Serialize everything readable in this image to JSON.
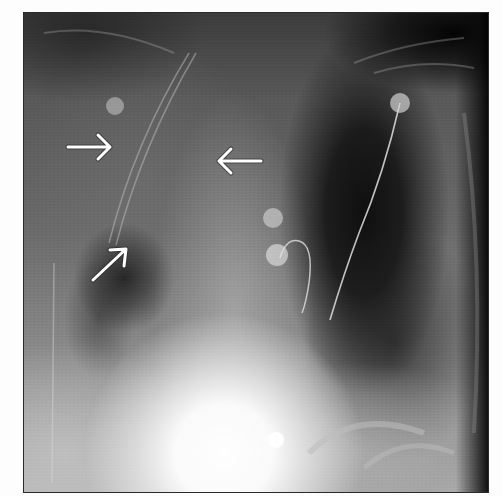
{
  "image": {
    "type": "chest radiograph (frontal view)",
    "frame": {
      "left": 24,
      "top": 13,
      "width": 464,
      "height": 479
    },
    "colors": {
      "page_background": "#fdfdfd",
      "dark_lung": "#141414",
      "mid_gray": "#6a6a6a",
      "bright_heart": "#ffffff",
      "annotation_arrow": "#ffffff"
    }
  },
  "annotations": {
    "arrows": [
      {
        "id": "arrow-right",
        "direction": "right",
        "from": [
          67,
          147
        ],
        "to": [
          111,
          147
        ]
      },
      {
        "id": "arrow-left",
        "direction": "left",
        "from": [
          262,
          161
        ],
        "to": [
          218,
          161
        ]
      },
      {
        "id": "arrow-up-right",
        "direction": "up-right",
        "from": [
          93,
          280
        ],
        "to": [
          127,
          248
        ]
      }
    ]
  },
  "devices": {
    "ecg_electrodes": [
      {
        "x": 115,
        "y": 106,
        "r": 9
      },
      {
        "x": 400,
        "y": 103,
        "r": 10
      },
      {
        "x": 273,
        "y": 218,
        "r": 10
      },
      {
        "x": 277,
        "y": 255,
        "r": 11
      },
      {
        "x": 276,
        "y": 440,
        "r": 8
      }
    ],
    "lead_wire": {
      "from": [
        400,
        103
      ],
      "to": [
        330,
        320
      ]
    },
    "wire_loop": {
      "center": [
        294,
        265
      ]
    }
  }
}
